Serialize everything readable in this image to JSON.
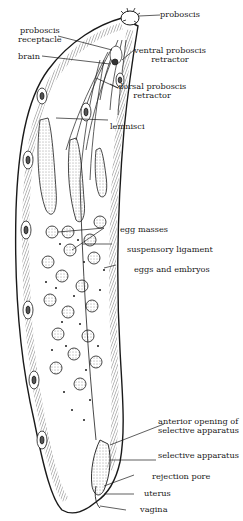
{
  "figure": {
    "labels": [
      {
        "id": "proboscis",
        "lines": [
          "proboscis"
        ]
      },
      {
        "id": "proboscis_receptacle",
        "lines": [
          "proboscis",
          "receptacle"
        ]
      },
      {
        "id": "brain",
        "lines": [
          "brain"
        ]
      },
      {
        "id": "ventral_proboscis_retractor",
        "lines": [
          "ventral proboscis",
          "retractor"
        ]
      },
      {
        "id": "dorsal_proboscis_retractor",
        "lines": [
          "dorsal proboscis",
          "retractor"
        ]
      },
      {
        "id": "lemnisci",
        "lines": [
          "lemnisci"
        ]
      },
      {
        "id": "egg_masses",
        "lines": [
          "egg masses"
        ]
      },
      {
        "id": "suspensory_ligament",
        "lines": [
          "suspensory ligament"
        ]
      },
      {
        "id": "eggs_and_embryos",
        "lines": [
          "eggs and embryos"
        ]
      },
      {
        "id": "anterior_opening",
        "lines": [
          "anterior opening of",
          "selective apparatus"
        ]
      },
      {
        "id": "selective_apparatus",
        "lines": [
          "selective apparatus"
        ]
      },
      {
        "id": "rejection_pore",
        "lines": [
          "rejection pore"
        ]
      },
      {
        "id": "uterus",
        "lines": [
          "uterus"
        ]
      },
      {
        "id": "vagina",
        "lines": [
          "vagina"
        ]
      }
    ]
  },
  "labels": {
    "proboscis": "proboscis",
    "proboscis_receptacle_1": "proboscis",
    "proboscis_receptacle_2": "receptacle",
    "brain": "brain",
    "ventral_1": "ventral proboscis",
    "ventral_2": "retractor",
    "dorsal_1": "dorsal proboscis",
    "dorsal_2": "retractor",
    "lemnisci": "lemnisci",
    "egg_masses": "egg masses",
    "suspensory_ligament": "suspensory ligament",
    "eggs_and_embryos": "eggs and embryos",
    "anterior_1": "anterior opening of",
    "anterior_2": "selective apparatus",
    "selective_apparatus": "selective apparatus",
    "rejection_pore": "rejection pore",
    "uterus": "uterus",
    "vagina": "vagina"
  },
  "colors": {
    "ink": "#1a1a1a",
    "paper": "#ffffff"
  }
}
